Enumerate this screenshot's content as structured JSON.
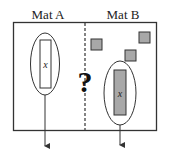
{
  "mats": {
    "a": {
      "label": "Mat A"
    },
    "b": {
      "label": "Mat B"
    }
  },
  "variable_label": "x",
  "unknown_symbol": "?",
  "colors": {
    "stroke": "#333333",
    "tile_fill": "#a8a8a8",
    "x_tile_fill_a": "#ffffff",
    "x_tile_fill_b": "#a8a8a8",
    "background": "#ffffff"
  },
  "mat_b_unit_tiles": 3
}
